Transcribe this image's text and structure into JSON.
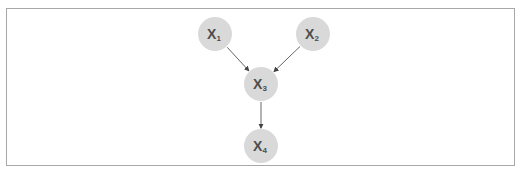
{
  "diagram": {
    "type": "directed-graph",
    "nodes": [
      {
        "id": "x1",
        "label": "X",
        "subscript": "1"
      },
      {
        "id": "x2",
        "label": "X",
        "subscript": "2"
      },
      {
        "id": "x3",
        "label": "X",
        "subscript": "3"
      },
      {
        "id": "x4",
        "label": "X",
        "subscript": "4"
      }
    ],
    "edges": [
      {
        "from": "x1",
        "to": "x3"
      },
      {
        "from": "x2",
        "to": "x3"
      },
      {
        "from": "x3",
        "to": "x4"
      }
    ],
    "colors": {
      "node_fill": "#d9d9d9",
      "label": "#4d4d4d",
      "edge": "#555555",
      "border": "#a8a8a8"
    }
  }
}
